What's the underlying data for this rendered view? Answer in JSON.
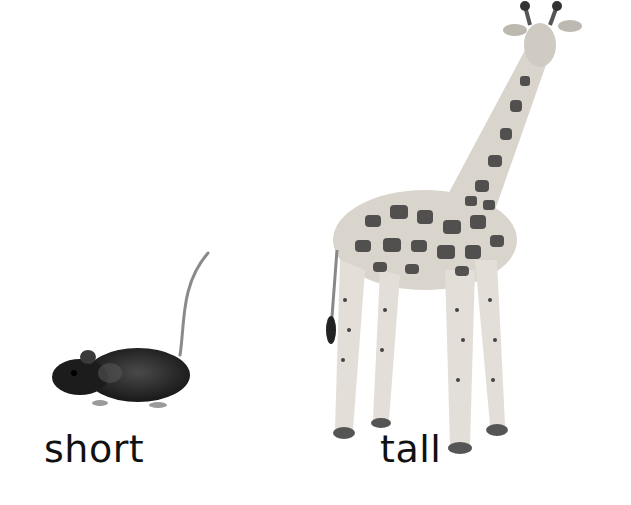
{
  "scene": {
    "description": "Comparison illustration of a short animal and a tall animal",
    "background_color": "#ffffff"
  },
  "items": [
    {
      "animal": "mouse",
      "label": "short",
      "body_color": "#1e1e1e"
    },
    {
      "animal": "giraffe",
      "label": "tall",
      "body_color": "#d9d4cc",
      "spot_color": "#3a3a3a"
    }
  ]
}
